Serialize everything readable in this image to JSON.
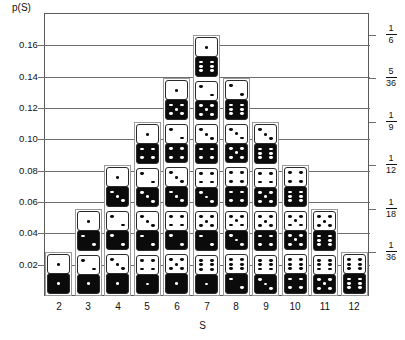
{
  "axes": {
    "y_title": "p(S)",
    "x_title": "S",
    "y_ticks": [
      "0.02",
      "0.04",
      "0.06",
      "0.08",
      "0.10",
      "0.12",
      "0.14",
      "0.16"
    ],
    "y_tick_values": [
      0.02,
      0.04,
      0.06,
      0.08,
      0.1,
      0.12,
      0.14,
      0.16
    ],
    "x_ticks": [
      "2",
      "3",
      "4",
      "5",
      "6",
      "7",
      "8",
      "9",
      "10",
      "11",
      "12"
    ],
    "right_fractions": [
      {
        "num": "1",
        "den": "6",
        "value": 0.166667
      },
      {
        "num": "5",
        "den": "36",
        "value": 0.138889
      },
      {
        "num": "1",
        "den": "9",
        "value": 0.111111
      },
      {
        "num": "1",
        "den": "12",
        "value": 0.083333
      },
      {
        "num": "1",
        "den": "18",
        "value": 0.055556
      },
      {
        "num": "1",
        "den": "36",
        "value": 0.027778
      }
    ]
  },
  "colors": {
    "frame": "#5a5a5a",
    "grid": "#6e6e6e",
    "bar_outline": "#9a9a9a",
    "die_white_bg": "#ffffff",
    "die_black_bg": "#0b0b0b",
    "text": "#111111"
  },
  "chart_data": {
    "type": "bar",
    "title": "",
    "subtitle": "",
    "xlabel": "S",
    "ylabel": "p(S)",
    "xlim": [
      1.5,
      12.5
    ],
    "ylim": [
      0,
      0.1806
    ],
    "grid": true,
    "legend": "none",
    "note": "Probability distribution of the sum S of two dice; each bar is a stack of cells, one per ordered outcome (white die value, black die value).",
    "categories": [
      2,
      3,
      4,
      5,
      6,
      7,
      8,
      9,
      10,
      11,
      12
    ],
    "values": [
      0.02778,
      0.05556,
      0.08333,
      0.11111,
      0.13889,
      0.16667,
      0.13889,
      0.11111,
      0.08333,
      0.05556,
      0.02778
    ],
    "counts": [
      1,
      2,
      3,
      4,
      5,
      6,
      5,
      4,
      3,
      2,
      1
    ],
    "fractions": [
      "1/36",
      "2/36",
      "3/36",
      "4/36",
      "5/36",
      "6/36",
      "5/36",
      "4/36",
      "3/36",
      "2/36",
      "1/36"
    ],
    "cell_value": 0.027778,
    "columns": [
      {
        "sum": 2,
        "outcomes": [
          [
            1,
            1
          ]
        ]
      },
      {
        "sum": 3,
        "outcomes": [
          [
            1,
            2
          ],
          [
            2,
            1
          ]
        ]
      },
      {
        "sum": 4,
        "outcomes": [
          [
            1,
            3
          ],
          [
            2,
            2
          ],
          [
            3,
            1
          ]
        ]
      },
      {
        "sum": 5,
        "outcomes": [
          [
            1,
            4
          ],
          [
            2,
            3
          ],
          [
            3,
            2
          ],
          [
            4,
            1
          ]
        ]
      },
      {
        "sum": 6,
        "outcomes": [
          [
            1,
            5
          ],
          [
            2,
            4
          ],
          [
            3,
            3
          ],
          [
            4,
            2
          ],
          [
            5,
            1
          ]
        ]
      },
      {
        "sum": 7,
        "outcomes": [
          [
            1,
            6
          ],
          [
            2,
            5
          ],
          [
            3,
            4
          ],
          [
            4,
            3
          ],
          [
            5,
            2
          ],
          [
            6,
            1
          ]
        ]
      },
      {
        "sum": 8,
        "outcomes": [
          [
            2,
            6
          ],
          [
            3,
            5
          ],
          [
            4,
            4
          ],
          [
            5,
            3
          ],
          [
            6,
            2
          ]
        ]
      },
      {
        "sum": 9,
        "outcomes": [
          [
            3,
            6
          ],
          [
            4,
            5
          ],
          [
            5,
            4
          ],
          [
            6,
            3
          ]
        ]
      },
      {
        "sum": 10,
        "outcomes": [
          [
            4,
            6
          ],
          [
            5,
            5
          ],
          [
            6,
            4
          ]
        ]
      },
      {
        "sum": 11,
        "outcomes": [
          [
            5,
            6
          ],
          [
            6,
            5
          ]
        ]
      },
      {
        "sum": 12,
        "outcomes": [
          [
            6,
            6
          ]
        ]
      }
    ]
  }
}
